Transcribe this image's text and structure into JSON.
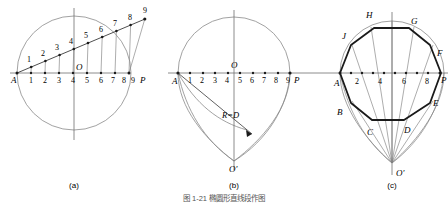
{
  "figure": {
    "caption_a": "(a)",
    "caption_b": "(b)",
    "caption_c": "(c)",
    "bottom_caption": "图 1-21  椭圆形直线段作图",
    "colors": {
      "construction_line": "#8a8a8a",
      "heavy_line": "#1a1a1a",
      "axis": "#6f6f6f",
      "text": "#000000"
    }
  },
  "panel_a": {
    "title": "(a)",
    "axis_start_label": "A",
    "axis_end_label": "P",
    "center_label": "O",
    "baseline_numbers": [
      "1",
      "2",
      "3",
      "4",
      "5",
      "6",
      "7",
      "8",
      "9"
    ],
    "oblique_numbers": [
      "1",
      "2",
      "3",
      "4",
      "5",
      "6",
      "7",
      "8",
      "9"
    ],
    "divisions": 9
  },
  "panel_b": {
    "title": "(b)",
    "axis_start_label": "A",
    "axis_end_label": "P",
    "center_label": "O",
    "lower_center_label": "O'",
    "radius_label": "R=D",
    "baseline_numbers": [
      "1",
      "2",
      "3",
      "4",
      "5",
      "6",
      "7",
      "8",
      "9"
    ]
  },
  "panel_c": {
    "title": "(c)",
    "axis_start_label": "A",
    "axis_end_label": "P",
    "lower_center_label": "O'",
    "baseline_numbers": [
      "2",
      "4",
      "6",
      "8"
    ],
    "vertices": [
      "A",
      "B",
      "C",
      "D",
      "E",
      "F",
      "G",
      "H",
      "J"
    ]
  }
}
